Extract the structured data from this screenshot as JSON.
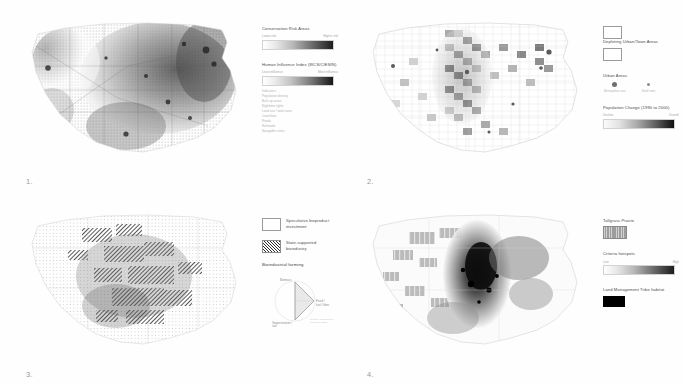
{
  "figure": {
    "panels": [
      {
        "number": "1.",
        "map_name": "conservation-risk-map",
        "legend": [
          {
            "type": "ramp",
            "title": "Conservation Risk Areas",
            "min_label": "Lower risk",
            "max_label": "Higher risk"
          },
          {
            "type": "ramp",
            "title": "Human Influence Index (WCS/CIESIN)",
            "min_label": "Least influence",
            "max_label": "Most influence",
            "sub_items": [
              "Indicators:",
              "Population density",
              "Built-up areas",
              "Nighttime lights",
              "Land use / land cover",
              "Coastlines",
              "Roads",
              "Railroads",
              "Navigable rivers"
            ]
          }
        ]
      },
      {
        "number": "2.",
        "map_name": "population-change-map",
        "legend": [
          {
            "type": "swatch",
            "title": "Depleting Urban/Town Areas",
            "swatch_style": "hollow"
          },
          {
            "type": "dots",
            "title": "Urban Areas",
            "dots": [
              {
                "size": "large",
                "caption": "Metropolitan core"
              },
              {
                "size": "small",
                "caption": "Small town"
              }
            ]
          },
          {
            "type": "ramp",
            "title": "Population Change (1990 to 2000)",
            "min_label": "Decline",
            "max_label": "Growth"
          }
        ]
      },
      {
        "number": "3.",
        "map_name": "bioindustry-investment-map",
        "legend": [
          {
            "type": "swatch",
            "title": "Speculative bioproduct investment",
            "swatch_style": "hollow"
          },
          {
            "type": "swatch",
            "title": "State-supported bioindustry",
            "swatch_style": "hatch"
          },
          {
            "type": "ternary",
            "title": "Bioindustrial farming",
            "vertices": [
              "Biomass",
              "Feed / fuel / fiber",
              "Sequestration / soil"
            ],
            "note": "Relative allocation of cropland output"
          }
        ]
      },
      {
        "number": "4.",
        "map_name": "tallgrass-criteria-map",
        "legend": [
          {
            "type": "swatch",
            "title": "Tallgrass Prairie",
            "swatch_style": "gray"
          },
          {
            "type": "ramp",
            "title": "Criteria hotspots",
            "min_label": "Low",
            "max_label": "High"
          },
          {
            "type": "swatch",
            "title": "Land Management Tribe habitat",
            "swatch_style": "black"
          }
        ]
      }
    ]
  }
}
